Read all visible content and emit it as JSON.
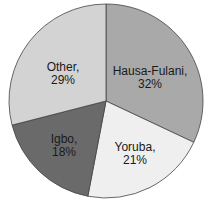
{
  "chart_data": {
    "type": "pie",
    "title": "",
    "categories": [
      "Hausa-Fulani",
      "Yoruba",
      "Igbo",
      "Other"
    ],
    "values": [
      32,
      21,
      18,
      29
    ],
    "unit": "%",
    "labels": [
      "Hausa-Fulani, 32%",
      "Yoruba, 21%",
      "Igbo, 18%",
      "Other, 29%"
    ],
    "colors": [
      "#a9a9a9",
      "#efefef",
      "#6a6a6a",
      "#d3d3d3"
    ],
    "start_angle": "12 o'clock",
    "direction": "clockwise",
    "legend": "none (labels inside slices)"
  },
  "slices": [
    {
      "name": "Hausa-Fulani,",
      "pct": "32%",
      "color": "#a9a9a9"
    },
    {
      "name": "Yoruba,",
      "pct": "21%",
      "color": "#efefef"
    },
    {
      "name": "Igbo,",
      "pct": "18%",
      "color": "#6a6a6a"
    },
    {
      "name": "Other,",
      "pct": "29%",
      "color": "#d3d3d3"
    }
  ]
}
